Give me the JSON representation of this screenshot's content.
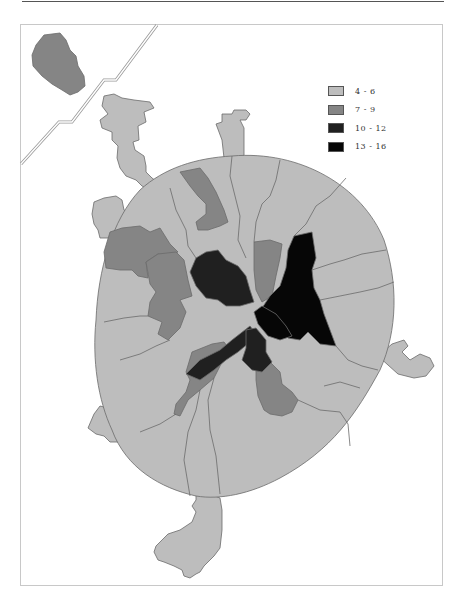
{
  "map": {
    "type": "choropleth",
    "legend": {
      "items": [
        {
          "label": "4 - 6",
          "color": "#bdbdbd"
        },
        {
          "label": "7 - 9",
          "color": "#858585"
        },
        {
          "label": "10 - 12",
          "color": "#202020"
        },
        {
          "label": "13 - 16",
          "color": "#060606"
        }
      ]
    },
    "inset": {
      "category": "7 - 9",
      "color": "#858585"
    },
    "colors": {
      "light": "#bdbdbd",
      "medium": "#858585",
      "dark": "#202020",
      "black": "#060606",
      "boundary": "#6b6b6b",
      "frame": "#c8c8c8"
    }
  }
}
